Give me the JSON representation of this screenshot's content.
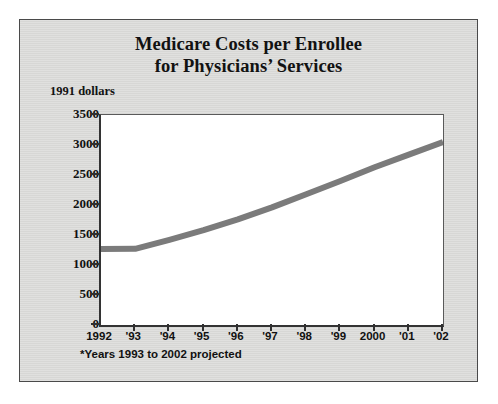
{
  "chart_data": {
    "type": "line",
    "title_line1": "Medicare Costs per Enrollee",
    "title_line2": "for Physicians’ Services",
    "ylabel": "1991 dollars",
    "xlabel": "",
    "footnote": "*Years 1993 to 2002 projected",
    "grid": false,
    "legend": "none",
    "ylim": [
      0,
      3500
    ],
    "yticks": [
      0,
      500,
      1000,
      1500,
      2000,
      2500,
      3000,
      3500
    ],
    "ytick_labels": [
      "0",
      "500",
      "1000",
      "1500",
      "2000",
      "2500",
      "3000",
      "3500"
    ],
    "categories": [
      "1992",
      "'93",
      "'94",
      "'95",
      "'96",
      "'97",
      "'98",
      "'99",
      "2000",
      "'01",
      "'02"
    ],
    "x": [
      1992,
      1993,
      1994,
      1995,
      1996,
      1997,
      1998,
      1999,
      2000,
      2001,
      2002
    ],
    "series": [
      {
        "name": "Medicare cost per enrollee",
        "color": "#7b7b7b",
        "values": [
          1265,
          1270,
          1420,
          1580,
          1760,
          1960,
          2180,
          2400,
          2630,
          2840,
          3050
        ]
      }
    ]
  },
  "figure": {
    "panel_background": "#d9d9d7",
    "plot_background": "#ffffff",
    "border_color": "#4a4a4a",
    "axis_color": "#2f2f2f",
    "line_color": "#7b7b7b",
    "text_color": "#111111"
  }
}
